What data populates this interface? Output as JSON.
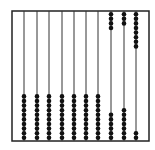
{
  "diagram": {
    "type": "abacus",
    "frame": {
      "x": 12,
      "y": 11,
      "width": 137,
      "height": 130,
      "color": "#222222"
    },
    "rod_color": "#333333",
    "bead_color": "#111111",
    "beads_per_rod": 10,
    "rods": [
      {
        "x": 24,
        "top_beads": 0,
        "bottom_beads": 10
      },
      {
        "x": 37,
        "top_beads": 0,
        "bottom_beads": 10
      },
      {
        "x": 49,
        "top_beads": 0,
        "bottom_beads": 10
      },
      {
        "x": 62,
        "top_beads": 0,
        "bottom_beads": 10
      },
      {
        "x": 74,
        "top_beads": 0,
        "bottom_beads": 10
      },
      {
        "x": 86,
        "top_beads": 0,
        "bottom_beads": 10
      },
      {
        "x": 98,
        "top_beads": 0,
        "bottom_beads": 10
      },
      {
        "x": 111,
        "top_beads": 4,
        "bottom_beads": 6
      },
      {
        "x": 124,
        "top_beads": 3,
        "bottom_beads": 7
      },
      {
        "x": 136,
        "top_beads": 8,
        "bottom_beads": 2
      }
    ]
  }
}
